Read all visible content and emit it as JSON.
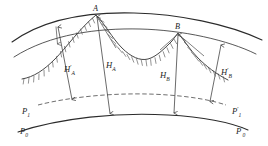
{
  "figure": {
    "background_color": "#ffffff",
    "line_color": "#2b2b2b",
    "points": [
      {
        "id": "A",
        "label": "A",
        "x": 96,
        "y": 15
      },
      {
        "id": "B",
        "label": "B",
        "x": 178,
        "y": 33
      }
    ],
    "dimensions": [
      {
        "id": "HA_prime",
        "base": "H",
        "sub": "A",
        "prime": "′",
        "label": "H'A",
        "label_x": 72,
        "label_y": 70,
        "from_x": 58,
        "from_y": 27,
        "to_x": 72,
        "to_y": 99
      },
      {
        "id": "HA",
        "base": "H",
        "sub": "A",
        "prime": "",
        "label": "HA",
        "label_x": 114,
        "label_y": 68,
        "from_x": 97,
        "from_y": 17,
        "to_x": 110,
        "to_y": 113
      },
      {
        "id": "HB",
        "base": "H",
        "sub": "B",
        "prime": "",
        "label": "HB",
        "label_x": 172,
        "label_y": 77,
        "from_x": 178,
        "from_y": 35,
        "to_x": 174,
        "to_y": 113
      },
      {
        "id": "HB_prime",
        "base": "H",
        "sub": "B",
        "prime": "′",
        "label": "H'B",
        "label_x": 228,
        "label_y": 74,
        "from_x": 220,
        "from_y": 45,
        "to_x": 210,
        "to_y": 101
      }
    ],
    "datum_labels": [
      {
        "id": "P1",
        "base": "P",
        "sub": "1",
        "prime": "",
        "label": "P1",
        "x": 28,
        "y": 113
      },
      {
        "id": "P0",
        "base": "P",
        "sub": "0",
        "prime": "",
        "label": "P0",
        "x": 26,
        "y": 133
      },
      {
        "id": "P1_prime",
        "base": "P",
        "sub": "1",
        "prime": "′",
        "label": "P'1",
        "x": 228,
        "y": 113
      },
      {
        "id": "P0_prime",
        "base": "P",
        "sub": "0",
        "prime": "′",
        "label": "P'0",
        "x": 232,
        "y": 133
      }
    ],
    "curves": {
      "top_arc": "top ellipsoid arc through A",
      "second_arc": "quasi-geoid arc through B",
      "dashed_arc": "dashed geoid / P1 surface",
      "bottom_arc": "reference ellipsoid P0",
      "terrain": "hachured ground surface with peaks at A and B"
    }
  }
}
